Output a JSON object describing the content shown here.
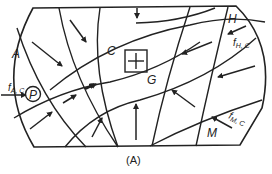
{
  "diagram": {
    "caption": "(A)",
    "regions": {
      "A": "A",
      "C": "C",
      "H": "H",
      "M": "M",
      "G": "G",
      "P": "P"
    },
    "forces": {
      "fAC": {
        "main": "f",
        "sub": "A, C"
      },
      "fHC": {
        "main": "f",
        "sub": "H, C"
      },
      "fMC": {
        "main": "f",
        "sub": "M, C"
      }
    },
    "colors": {
      "ink": "#222222",
      "background": "#ffffff"
    }
  }
}
